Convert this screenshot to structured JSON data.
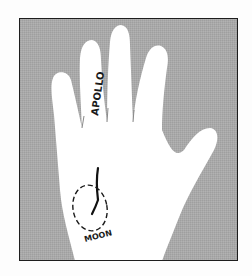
{
  "figure": {
    "labels": {
      "finger": "APOLLO",
      "mount": "MOON"
    },
    "colors": {
      "background": "#a9a9a9",
      "hand": "#ffffff",
      "line": "#111111",
      "border": "#1e1e1e"
    }
  }
}
